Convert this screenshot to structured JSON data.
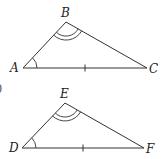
{
  "figure": {
    "partial_label": ")",
    "triangles": [
      {
        "name": "ABC",
        "vertices": [
          "A",
          "B",
          "C"
        ],
        "markings": {
          "A": "single angle arc",
          "B": "double angle arc",
          "AC": "single tick"
        }
      },
      {
        "name": "DEF",
        "vertices": [
          "D",
          "E",
          "F"
        ],
        "markings": {
          "D": "single angle arc",
          "E": "double angle arc",
          "DF": "single tick"
        }
      }
    ]
  }
}
